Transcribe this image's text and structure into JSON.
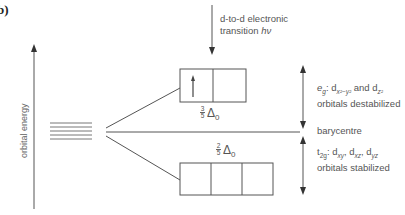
{
  "panel_label": "b)",
  "axis": {
    "label": "orbital energy"
  },
  "transition": {
    "line1": "d-to-d electronic",
    "line2_text": "transition ",
    "line2_symbol": "hν"
  },
  "eg_box": {
    "cells": 2,
    "electron": "up-arrow",
    "energy_fraction": {
      "num": "3",
      "den": "5"
    },
    "energy_symbol": "Δ",
    "energy_sub": "0"
  },
  "t2g_box": {
    "cells": 3,
    "energy_fraction": {
      "num": "2",
      "den": "5"
    },
    "energy_symbol": "Δ",
    "energy_sub": "0"
  },
  "annotations": {
    "eg": {
      "symbol": "e",
      "symbol_sub": "g",
      "text_colon": ": d",
      "orb1_sub": "x²−y²",
      "and": " and d",
      "orb2_sub": "z²",
      "line2": "orbitals destabilized"
    },
    "barycentre": "barycentre",
    "t2g": {
      "symbol": "t",
      "symbol_sub": "2g",
      "d1": ": d",
      "d1_sub": "xy",
      "d2": ", d",
      "d2_sub": "xz",
      "d3": ", d",
      "d3_sub": "yz",
      "line2": "orbitals stabilized"
    }
  },
  "colors": {
    "line": "#555555",
    "text": "#555555"
  }
}
